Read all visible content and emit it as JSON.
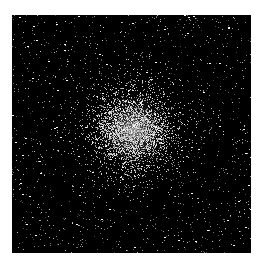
{
  "image": {
    "subject": "globular star cluster",
    "description": "Dense spherical cluster of stars on a black background, brightest at the core",
    "background_color": "#000000",
    "page_background": "#ffffff",
    "core_position": {
      "x": 121,
      "y": 115
    },
    "frame": {
      "left": 12,
      "top": 15,
      "width": 239,
      "height": 238
    }
  }
}
